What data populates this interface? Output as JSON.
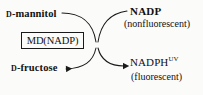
{
  "diagram": {
    "type": "enzymatic-reaction-scheme",
    "background_color": "#fbfbfa",
    "stroke_color": "#1a1a1a",
    "substrate": {
      "prefix": "D",
      "name": "-mannitol",
      "full": "D-mannitol"
    },
    "product": {
      "prefix": "D",
      "name": "-fructose",
      "full": "D-fructose"
    },
    "enzyme": {
      "label": "MD(NADP)"
    },
    "cofactor_in": {
      "name": "NADP",
      "note": "(nonfluorescent)"
    },
    "cofactor_out": {
      "name": "NADPH",
      "superscript": "UV",
      "note": "(fluorescent)"
    },
    "arrows": [
      {
        "name": "substrate-to-product-arrow",
        "from": "D-mannitol",
        "to": "D-fructose",
        "arrowhead": "solid-triangle-left"
      },
      {
        "name": "nadp-to-nadph-arrow",
        "from": "NADP",
        "to": "NADPH",
        "arrowhead": "solid-triangle-right"
      }
    ]
  }
}
